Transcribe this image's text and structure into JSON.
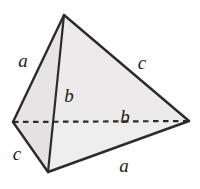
{
  "figure": {
    "type": "geometric-diagram",
    "shape": "tetrahedron",
    "background_color": "#ffffff",
    "stroke_color": "#2b2b2b",
    "face_fill_front": "#eceaea",
    "face_fill_left": "#e2e0e0",
    "face_fill_right": "#efeeee",
    "label_color": "#1c1c1c"
  },
  "vertices": {
    "apex": {
      "x": 64,
      "y": 15
    },
    "left": {
      "x": 13,
      "y": 122
    },
    "right": {
      "x": 189,
      "y": 121
    },
    "bottom": {
      "x": 48,
      "y": 172
    }
  },
  "edges": [
    {
      "id": "apex-left",
      "label": "a",
      "style": "solid"
    },
    {
      "id": "apex-right",
      "label": "c",
      "style": "solid"
    },
    {
      "id": "apex-bottom",
      "label": "b",
      "style": "solid"
    },
    {
      "id": "left-bottom",
      "label": "c",
      "style": "solid"
    },
    {
      "id": "bottom-right",
      "label": "a",
      "style": "solid"
    },
    {
      "id": "left-right",
      "label": "b",
      "style": "dashed"
    }
  ],
  "labels": [
    {
      "id": "label-a-upper-left",
      "text": "a",
      "x": 23,
      "y": 60
    },
    {
      "id": "label-c-upper-right",
      "text": "c",
      "x": 142,
      "y": 62
    },
    {
      "id": "label-b-vertical",
      "text": "b",
      "x": 69,
      "y": 95
    },
    {
      "id": "label-b-dashed",
      "text": "b",
      "x": 125,
      "y": 116
    },
    {
      "id": "label-c-lower-left",
      "text": "c",
      "x": 17,
      "y": 153
    },
    {
      "id": "label-a-lower-right",
      "text": "a",
      "x": 124,
      "y": 165
    }
  ]
}
